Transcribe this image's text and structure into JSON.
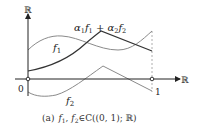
{
  "figure": {
    "axes": {
      "y_label": "ℝ",
      "x_label": "ℝ",
      "origin_label": "0",
      "one_label": "1"
    },
    "curves": [
      {
        "name": "f1",
        "label_main": "f",
        "label_sub": "1"
      },
      {
        "name": "f2",
        "label_main": "f",
        "label_sub": "2"
      },
      {
        "name": "alpha1f1+alpha2f2",
        "label": "α₁f₁ + α₂f₂"
      }
    ],
    "combo_label": {
      "a1": "α",
      "s1": "1",
      "f1": "f",
      "s2": "1",
      "plus": " + ",
      "a2": "α",
      "s3": "2",
      "f2": "f",
      "s4": "2"
    },
    "caption": {
      "tag": "(a)",
      "text_f1": "f",
      "sub1": "1",
      "comma": ", ",
      "text_f2": "f",
      "sub2": "2",
      "rest": "∈C((0, 1); ℝ)"
    },
    "colors": {
      "axis": "#222222",
      "f1": "#8a8a8a",
      "f2": "#8a8a8a",
      "combo": "#333333",
      "dashed": "#999999"
    }
  }
}
